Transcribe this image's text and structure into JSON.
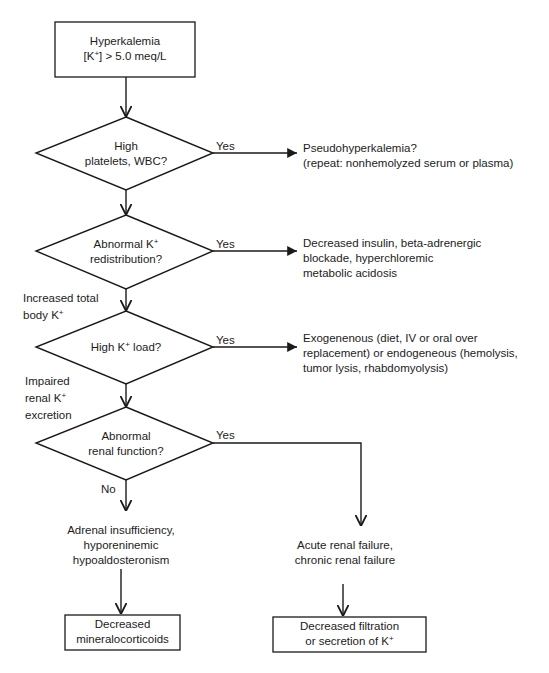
{
  "diagram": {
    "start": {
      "line1": "Hyperkalemia",
      "line2_pre": "[K",
      "line2_sup": "+",
      "line2_post": "] > 5.0 meq/L"
    },
    "decisions": [
      {
        "line1": "High",
        "line2": "platelets, WBC?",
        "yes_label": "Yes",
        "yes_outcome": [
          "Pseudohyperkalemia?",
          "(repeat: nonhemolyzed serum or plasma)"
        ]
      },
      {
        "line1_pre": "Abnormal K",
        "line1_sup": "+",
        "line2": "redistribution?",
        "yes_label": "Yes",
        "yes_outcome": [
          "Decreased insulin, beta-adrenergic",
          "blockade, hyperchloremic",
          "metabolic acidosis"
        ]
      },
      {
        "line1_pre": "High K",
        "line1_sup": "+",
        "line1_post": " load?",
        "yes_label": "Yes",
        "yes_outcome": [
          "Exogenenous (diet, IV or oral over",
          "replacement) or endogeneous (hemolysis,",
          "tumor lysis, rhabdomyolysis)"
        ]
      },
      {
        "line1": "Abnormal",
        "line2": "renal function?",
        "yes_label": "Yes",
        "no_label": "No"
      }
    ],
    "side_labels": {
      "increased_total": {
        "line1": "Increased total",
        "line2_pre": "body K",
        "line2_sup": "+"
      },
      "impaired_renal": {
        "line1": "Impaired",
        "line2_pre": "renal K",
        "line2_sup": "+",
        "line3": "excretion"
      }
    },
    "no_branch": {
      "cause": [
        "Adrenal insufficiency,",
        "hyporeninemic",
        "hypoaldosteronism"
      ],
      "result": [
        "Decreased",
        "mineralocorticoids"
      ]
    },
    "yes_branch": {
      "cause": [
        "Acute renal failure,",
        "chronic renal failure"
      ],
      "result_line1": "Decreased filtration",
      "result_line2_pre": "or secretion of K",
      "result_line2_sup": "+"
    },
    "colors": {
      "stroke": "#1a1a1a",
      "background": "#ffffff"
    }
  }
}
